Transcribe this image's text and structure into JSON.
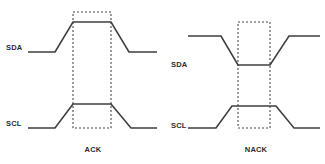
{
  "figure": {
    "background_color": "#ffffff",
    "line_color": "#3f3f3f",
    "marker_color": "#4a4a4a",
    "text_color": "#2b2b2b"
  },
  "panels": [
    {
      "id": "ack",
      "caption": "ACK",
      "signals": [
        {
          "id": "sda",
          "label": "SDA"
        },
        {
          "id": "scl",
          "label": "SCL"
        }
      ]
    },
    {
      "id": "nack",
      "caption": "NACK",
      "signals": [
        {
          "id": "sda",
          "label": "SDA"
        },
        {
          "id": "scl",
          "label": "SCL"
        }
      ]
    }
  ],
  "chart_data": {
    "type": "line",
    "xlabel": "",
    "ylabel": "",
    "grid": false,
    "legend": "none",
    "panels": [
      {
        "name": "ACK",
        "caption": "ACK",
        "marker_window": {
          "x0": 73,
          "x1": 111,
          "y_top": 12,
          "y_bottom": 128
        },
        "series": [
          {
            "name": "SDA",
            "label": "SDA",
            "level_low_y": 52,
            "level_high_y": 22,
            "points": [
              [
                28,
                52
              ],
              [
                55,
                52
              ],
              [
                73,
                22
              ],
              [
                111,
                22
              ],
              [
                129,
                52
              ],
              [
                157,
                52
              ]
            ]
          },
          {
            "name": "SCL",
            "label": "SCL",
            "level_low_y": 128,
            "level_high_y": 104,
            "points": [
              [
                28,
                128
              ],
              [
                55,
                128
              ],
              [
                73,
                104
              ],
              [
                111,
                104
              ],
              [
                131,
                128
              ],
              [
                157,
                128
              ]
            ]
          }
        ]
      },
      {
        "name": "NACK",
        "caption": "NACK",
        "marker_window": {
          "x0": 238,
          "x1": 270,
          "y_top": 22,
          "y_bottom": 128
        },
        "series": [
          {
            "name": "SDA",
            "label": "SDA",
            "level_low_y": 65,
            "level_high_y": 36,
            "points": [
              [
                188,
                36
              ],
              [
                221,
                36
              ],
              [
                238,
                65
              ],
              [
                270,
                65
              ],
              [
                289,
                36
              ],
              [
                320,
                36
              ]
            ]
          },
          {
            "name": "SCL",
            "label": "SCL",
            "level_low_y": 128,
            "level_high_y": 106,
            "points": [
              [
                188,
                128
              ],
              [
                216,
                128
              ],
              [
                232,
                106
              ],
              [
                276,
                106
              ],
              [
                294,
                128
              ],
              [
                320,
                128
              ]
            ]
          }
        ]
      }
    ]
  },
  "labels": {
    "ack_sda": "SDA",
    "ack_scl": "SCL",
    "ack_caption": "ACK",
    "nack_sda": "SDA",
    "nack_scl": "SCL",
    "nack_caption": "NACK"
  }
}
